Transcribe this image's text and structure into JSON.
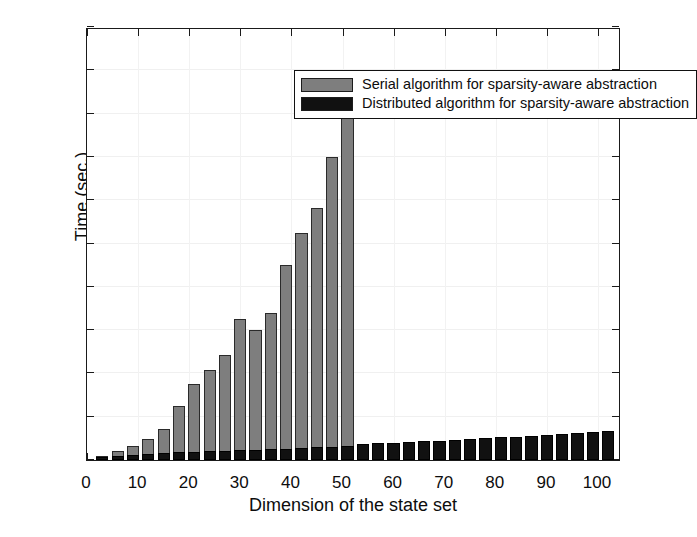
{
  "chart_data": {
    "type": "bar",
    "title": "",
    "xlabel": "Dimension of the state set",
    "ylabel": "Time (sec.)",
    "xlim": [
      0,
      104.5
    ],
    "ylim": [
      0,
      200
    ],
    "grid": true,
    "legend_position": "top-center",
    "x_ticks": [
      0,
      10,
      20,
      30,
      40,
      50,
      60,
      70,
      80,
      90,
      100
    ],
    "y_ticks": [
      0,
      20,
      40,
      60,
      80,
      100,
      120,
      140,
      160,
      180,
      200
    ],
    "x": [
      3,
      6,
      9,
      12,
      15,
      18,
      21,
      24,
      27,
      30,
      33,
      36,
      39,
      42,
      45,
      48,
      51,
      54,
      57,
      60,
      63,
      66,
      69,
      72,
      75,
      78,
      81,
      84,
      87,
      90,
      93,
      96,
      99,
      102
    ],
    "series": [
      {
        "name": "Serial algorithm for sparsity-aware abstraction",
        "color": "#7e7e7e",
        "values": [
          2.0,
          4.0,
          6.5,
          9.5,
          14.5,
          25.0,
          35.0,
          41.5,
          48.5,
          65.0,
          60.0,
          68.0,
          90.0,
          105.0,
          116.5,
          140.0,
          160.5,
          null,
          null,
          null,
          null,
          null,
          null,
          null,
          null,
          null,
          null,
          null,
          null,
          null,
          null,
          null,
          null,
          null
        ]
      },
      {
        "name": "Distributed algorithm for sparsity-aware abstraction",
        "color": "#111111",
        "values": [
          1.5,
          2.0,
          2.5,
          3.0,
          3.2,
          3.5,
          3.8,
          4.0,
          4.2,
          4.5,
          4.8,
          5.0,
          5.2,
          5.5,
          5.8,
          6.0,
          6.5,
          7.5,
          7.8,
          8.0,
          8.3,
          8.6,
          9.0,
          9.3,
          9.6,
          10.0,
          10.4,
          10.8,
          11.2,
          11.6,
          12.0,
          12.4,
          12.8,
          13.2
        ]
      }
    ]
  },
  "legend": {
    "items": [
      {
        "label": "Serial algorithm for sparsity-aware abstraction",
        "swatch": "#7e7e7e"
      },
      {
        "label": "Distributed algorithm for sparsity-aware abstraction",
        "swatch": "#111111"
      }
    ]
  },
  "axes": {
    "y_title": "Time (sec.)",
    "x_title": "Dimension of the state set"
  }
}
